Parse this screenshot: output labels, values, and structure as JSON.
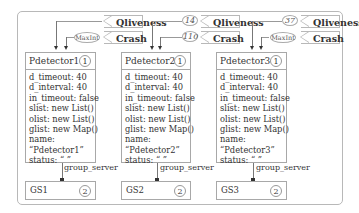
{
  "diagram": {
    "columns": [
      {
        "qliveness": {
          "label": "Qliveness",
          "value": ""
        },
        "crash": {
          "label": "Crash",
          "value": "MaxInt"
        },
        "detector": {
          "name": "Pdetector1",
          "id": "1",
          "fields": [
            "d_timeout: 40",
            "d_interval: 40",
            "in_timeout: false",
            "slist: new List()",
            "olist: new List()",
            "glist: new Map()",
            "name:",
            "“Pdetector1”",
            "status: “ ”"
          ]
        },
        "link_label": "group_server",
        "server": {
          "name": "GS1",
          "id": "2"
        }
      },
      {
        "qliveness": {
          "label": "Qliveness",
          "value": "14"
        },
        "crash": {
          "label": "Crash",
          "value": "110"
        },
        "detector": {
          "name": "Pdetector2",
          "id": "1",
          "fields": [
            "d_timeout: 40",
            "d_interval: 40",
            "in_timeout: false",
            "slist: new List()",
            "olist: new List()",
            "glist: new Map()",
            "name:",
            "“Pdetector2”",
            "status: “ ”"
          ]
        },
        "link_label": "group_server",
        "server": {
          "name": "GS2",
          "id": "2"
        }
      },
      {
        "qliveness": {
          "label": "Qliveness",
          "value": "37"
        },
        "crash": {
          "label": "Crash",
          "value": "MaxInt"
        },
        "detector": {
          "name": "Pdetector3",
          "id": "1",
          "fields": [
            "d_timeout: 40",
            "d_interval: 40",
            "in_timeout: false",
            "slist: new List()",
            "olist: new List()",
            "glist: new Map()",
            "name:",
            "“Pdetector3”",
            "status: “ ”"
          ]
        },
        "link_label": "group_server",
        "server": {
          "name": "GS3",
          "id": "2"
        }
      }
    ]
  }
}
